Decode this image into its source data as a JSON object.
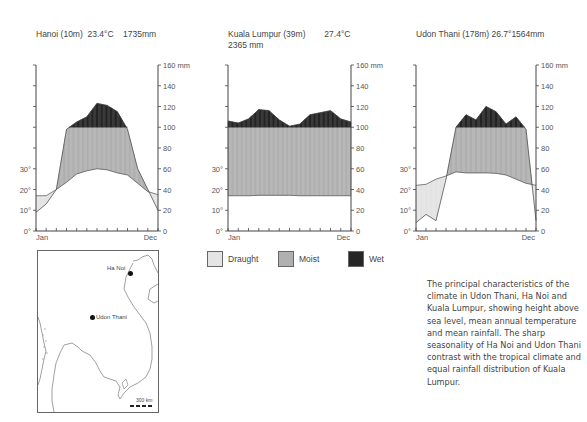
{
  "chart_data": [
    {
      "type": "area",
      "title": "Hanoi (10m)  23.4°C    1735mm",
      "station": "Hanoi",
      "elevation": "10m",
      "mean_temp": "23.4°C",
      "annual_rainfall": "1735mm",
      "xlabel_left": "Jan",
      "xlabel_right": "Dec",
      "categories": [
        "Jan",
        "Feb",
        "Mar",
        "Apr",
        "May",
        "Jun",
        "Jul",
        "Aug",
        "Sep",
        "Oct",
        "Nov",
        "Dec"
      ],
      "series": [
        {
          "name": "Temperature (°C)",
          "values": [
            17,
            17,
            20,
            23.5,
            27.5,
            29,
            30,
            29.5,
            28,
            27,
            23,
            19,
            17.5
          ]
        },
        {
          "name": "Rainfall (mm)",
          "values": [
            18,
            26,
            40,
            98,
            105,
            110,
            123,
            121,
            115,
            98,
            60,
            40,
            20
          ]
        }
      ],
      "y_left": {
        "label": "°C",
        "ticks": [
          "0°",
          "10°",
          "20°",
          "30°"
        ]
      },
      "y_right": {
        "label": "mm",
        "ticks": [
          "0",
          "20",
          "40",
          "60",
          "80",
          "100",
          "120",
          "140",
          "160 mm"
        ],
        "range": [
          0,
          160
        ]
      }
    },
    {
      "type": "area",
      "title": "Kuala Lumpur (39m)        27.4°C\n2365 mm",
      "station": "Kuala Lumpur",
      "elevation": "39m",
      "mean_temp": "27.4°C",
      "annual_rainfall": "2365 mm",
      "xlabel_left": "Jan",
      "xlabel_right": "Dec",
      "categories": [
        "Jan",
        "Feb",
        "Mar",
        "Apr",
        "May",
        "Jun",
        "Jul",
        "Aug",
        "Sep",
        "Oct",
        "Nov",
        "Dec"
      ],
      "series": [
        {
          "name": "Temperature (°C)",
          "values": [
            17,
            17,
            17,
            17.2,
            17.2,
            17.2,
            17.2,
            17,
            17,
            17,
            17,
            17,
            17
          ]
        },
        {
          "name": "Rainfall (mm)",
          "values": [
            106,
            104,
            108,
            117,
            116,
            107,
            101,
            103,
            112,
            114,
            116,
            108,
            105
          ]
        }
      ],
      "y_left": {
        "label": "°C",
        "ticks": [
          "0°",
          "10°",
          "20°",
          "30°"
        ]
      },
      "y_right": {
        "label": "mm",
        "ticks": [
          "0",
          "20",
          "40",
          "60",
          "80",
          "100",
          "120",
          "140",
          "160 mm"
        ],
        "range": [
          0,
          160
        ]
      }
    },
    {
      "type": "area",
      "title": "Udon Thani (178m) 26.7°1564mm",
      "station": "Udon Thani",
      "elevation": "178m",
      "mean_temp": "26.7°",
      "annual_rainfall": "1564mm",
      "xlabel_left": "Jan",
      "xlabel_right": "Dec",
      "categories": [
        "Jan",
        "Feb",
        "Mar",
        "Apr",
        "May",
        "Jun",
        "Jul",
        "Aug",
        "Sep",
        "Oct",
        "Nov",
        "Dec"
      ],
      "series": [
        {
          "name": "Temperature (°C)",
          "values": [
            22,
            22.5,
            25,
            26.5,
            28.5,
            28,
            28,
            28,
            27.8,
            27,
            25,
            23,
            22
          ]
        },
        {
          "name": "Rainfall (mm)",
          "values": [
            8,
            16,
            10,
            50,
            100,
            112,
            107,
            120,
            115,
            103,
            110,
            98,
            10
          ]
        }
      ],
      "y_left": {
        "label": "°C",
        "ticks": [
          "0°",
          "10°",
          "20°",
          "30°"
        ]
      },
      "y_right": {
        "label": "mm",
        "ticks": [
          "0",
          "20",
          "40",
          "60",
          "80",
          "100",
          "120",
          "140",
          "160 mm"
        ],
        "range": [
          0,
          160
        ]
      }
    }
  ],
  "legend": [
    {
      "label": "Draught",
      "color": "#e4e4e4"
    },
    {
      "label": "Moist",
      "color": "#b0b0b0"
    },
    {
      "label": "Wet",
      "color": "#262626"
    }
  ],
  "map": {
    "places": [
      {
        "name": "Ha Noi"
      },
      {
        "name": "Udon Thani"
      }
    ],
    "scale_label": "300 km"
  },
  "caption": "The principal characteristics of the climate in Udon Thani, Ha Noi and Kuala Lumpur, showing height above sea level, mean annual temperature and mean rainfall. The sharp seasonality of Ha Noi and Udon Thani contrast with the tropical climate and equal rainfall distribution of Kuala Lumpur."
}
